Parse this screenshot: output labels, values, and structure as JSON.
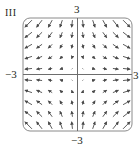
{
  "figure": {
    "panel_label": "III",
    "axis_labels": {
      "y_top": "3",
      "y_bottom": "−3",
      "x_left": "−3",
      "x_right": "3"
    },
    "colors": {
      "frame": "#8a8a8a",
      "axes": "#6d6d6d",
      "arrows": "#4a4a4a",
      "text": "#231f20"
    }
  },
  "chart_data": {
    "type": "vector_field",
    "title": "III",
    "field": "F(x, y) = <x, -y>",
    "xlim": [
      -3,
      3
    ],
    "ylim": [
      -3,
      3
    ],
    "x_tick_labels": [
      "-3",
      "3"
    ],
    "y_tick_labels": [
      "-3",
      "3"
    ],
    "grid_points_per_axis": 10,
    "grid_coords": [
      -2.7,
      -2.1,
      -1.5,
      -0.9,
      -0.3,
      0.3,
      0.9,
      1.5,
      2.1,
      2.7
    ],
    "grid": false,
    "frame": "rounded square"
  }
}
